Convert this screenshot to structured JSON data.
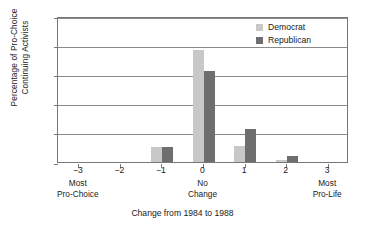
{
  "chart_data": {
    "type": "bar",
    "title": "",
    "xlabel": "Change from 1984 to 1988",
    "ylabel": "Percentage of Pro-Choice Continuing Activists",
    "ylabel_lines": [
      "Percentage of Pro-Choice",
      "Continuing Activists"
    ],
    "categories": [
      "-3",
      "-2",
      "-1",
      "0",
      "1",
      "2",
      "3"
    ],
    "x_tick_labels": [
      "−3",
      "−2",
      "−1",
      "0",
      "1",
      "2",
      "3"
    ],
    "x_annotations": [
      {
        "at": "-3",
        "lines": [
          "Most",
          "Pro-Choice"
        ]
      },
      {
        "at": "0",
        "lines": [
          "No",
          "Change"
        ]
      },
      {
        "at": "3",
        "lines": [
          "Most",
          "Pro-Life"
        ]
      }
    ],
    "series": [
      {
        "name": "Democrat",
        "color": "#c8c8c8",
        "values": [
          0,
          0,
          10,
          77,
          11,
          1.5,
          0
        ]
      },
      {
        "name": "Republican",
        "color": "#6e6e6e",
        "values": [
          0,
          0,
          10,
          62,
          22.5,
          4,
          0
        ]
      }
    ],
    "ylim": [
      0,
      100
    ],
    "y_ticks": [
      0,
      20,
      40,
      60,
      80,
      100
    ],
    "y_tick_labels": [
      "0",
      "20",
      "40",
      "60",
      "80",
      "100"
    ],
    "grid": true,
    "legend_position": "top-right"
  },
  "legend": {
    "items": [
      {
        "label": "Democrat",
        "color": "#c8c8c8"
      },
      {
        "label": "Republican",
        "color": "#6e6e6e"
      }
    ]
  }
}
